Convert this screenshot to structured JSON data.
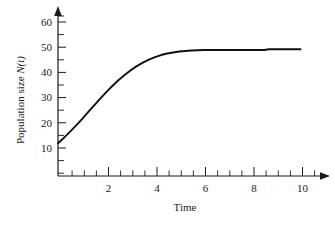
{
  "chart_data": {
    "type": "line",
    "title": "",
    "subtitle": "",
    "xlabel": "Time",
    "ylabel": "Population size N(t)",
    "ylabel_main": "Population size ",
    "ylabel_italic": "N(t)",
    "xlim": [
      0,
      10.6
    ],
    "ylim": [
      0,
      63
    ],
    "grid": false,
    "legend": null,
    "x_ticks_major": [
      2,
      4,
      6,
      8,
      10
    ],
    "x_tick_labels": [
      "2",
      "4",
      "6",
      "8",
      "10"
    ],
    "x_ticks_minor": [
      1,
      3,
      5,
      7,
      9
    ],
    "y_ticks_major": [
      10,
      20,
      30,
      40,
      50,
      60
    ],
    "y_tick_labels": [
      "10",
      "20",
      "30",
      "40",
      "50",
      "60"
    ],
    "y_ticks_minor": [
      5,
      15,
      25,
      35,
      45,
      55
    ],
    "series": [
      {
        "name": "Population size N(t)",
        "color": "#111111",
        "x": [
          0.0,
          0.25,
          0.5,
          0.75,
          1.0,
          1.25,
          1.5,
          1.75,
          2.0,
          2.25,
          2.5,
          2.75,
          3.0,
          3.25,
          3.5,
          3.75,
          4.0,
          4.25,
          4.5,
          4.75,
          5.0,
          5.25,
          5.5,
          5.75,
          6.0,
          6.5,
          7.0,
          7.5,
          8.0,
          8.5,
          8.7,
          9.0,
          9.5,
          10.0
        ],
        "y": [
          13.0,
          15.2,
          17.6,
          20.1,
          22.7,
          25.4,
          28.1,
          30.8,
          33.4,
          35.8,
          38.1,
          40.1,
          42.0,
          43.6,
          45.0,
          46.2,
          47.2,
          48.0,
          48.6,
          49.0,
          49.4,
          49.6,
          49.8,
          49.9,
          50.0,
          50.0,
          50.0,
          50.0,
          50.0,
          50.0,
          50.3,
          50.3,
          50.3,
          50.3
        ]
      }
    ],
    "annotations": [
      {
        "text": "carrying capacity plateau at 50",
        "visible": false
      }
    ]
  },
  "axes": {
    "x_axis_name": "time-axis",
    "y_axis_name": "population-axis",
    "x_arrow": true,
    "y_arrow": true
  }
}
